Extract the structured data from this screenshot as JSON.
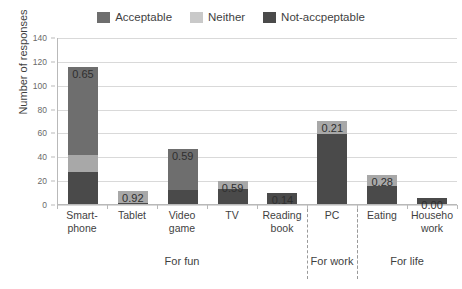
{
  "chart_data": {
    "type": "bar",
    "title": "",
    "xlabel": "",
    "ylabel": "Number of responses",
    "ylim": [
      0,
      140
    ],
    "ytick_step": 20,
    "yticks": [
      0,
      20,
      40,
      60,
      80,
      100,
      120,
      140
    ],
    "grid": true,
    "stacked": true,
    "legend_position": "top-center",
    "legend": [
      "Acceptable",
      "Neither",
      "Not-accpeptable"
    ],
    "colors": {
      "acceptable": "#6e6e6e",
      "neither": "#a8a8a8",
      "not_acceptable": "#4a4a4a",
      "gridline": "#d9d9d9",
      "axis": "#b9b9b9",
      "text": "#3f3f3f"
    },
    "categories": [
      "Smart-\nphone",
      "Tablet",
      "Video\ngame",
      "TV",
      "Reading\nbook",
      "PC",
      "Eating",
      "Househo\nwork"
    ],
    "series": [
      {
        "name": "Acceptable",
        "values": [
          74,
          0,
          34,
          0,
          0,
          0,
          0,
          0
        ]
      },
      {
        "name": "Neither",
        "values": [
          14,
          10,
          0,
          6,
          0,
          11,
          9,
          0
        ]
      },
      {
        "name": "Not-accpeptable",
        "values": [
          27,
          1,
          12,
          13,
          9,
          59,
          15,
          5
        ]
      }
    ],
    "totals": [
      115,
      11,
      46,
      19,
      9,
      70,
      24,
      5
    ],
    "data_labels": [
      "0.65",
      "0.92",
      "0.59",
      "0.59",
      "0.14",
      "0.21",
      "0.28",
      "0.00"
    ],
    "groups": [
      {
        "label": "For fun",
        "start": 0,
        "end": 4
      },
      {
        "label": "For work",
        "start": 5,
        "end": 5
      },
      {
        "label": "For life",
        "start": 6,
        "end": 7
      }
    ]
  }
}
